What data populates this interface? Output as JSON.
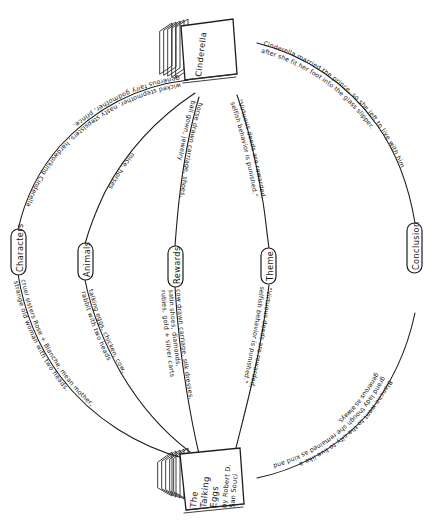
{
  "document": {
    "type": "hand-drawn mind map",
    "title": "Cinderella / The Talking Eggs comparison mind map",
    "ink_color": "#1d1d1d",
    "paper_color": "#ffffff"
  },
  "top_book": {
    "name": "Cinderella",
    "label": "Cinderella"
  },
  "bottom_book": {
    "name": "The Talking Eggs",
    "line1": "The",
    "line2": "Talking",
    "line3": "Eggs",
    "line4": "by Robert D.",
    "line5": "San Souci"
  },
  "nodes": [
    {
      "id": "characters",
      "label": "Characters"
    },
    {
      "id": "animals",
      "label": "Animals"
    },
    {
      "id": "rewards",
      "label": "Rewards"
    },
    {
      "id": "theme",
      "label": "Theme"
    },
    {
      "id": "conclusion",
      "label": "Conclusion"
    }
  ],
  "branches_top": [
    {
      "node": "characters",
      "side": "top",
      "line1": "wicked stepmother, nasty stepsisters, hardworking Cinderella",
      "line2": "generous fairy godmother, prince."
    },
    {
      "node": "animals",
      "side": "top",
      "line1": "mice, horses"
    },
    {
      "node": "rewards",
      "side": "top",
      "line1": "horse drawn carriage, shoes,",
      "line2": "ball gown, jewelry"
    },
    {
      "node": "theme",
      "side": "top",
      "line1": "\"Virtuous deeds are rewarded,",
      "line2": "selfish behavior is punished.\""
    },
    {
      "node": "conclusion",
      "side": "top",
      "line1": "Cinderella married the prince, so she left to live with him",
      "line2": "after she fit her foot into the glass slipper."
    }
  ],
  "branches_bottom": [
    {
      "node": "characters",
      "side": "bottom",
      "line1": "cruel sisters Rose + Blanche, mean mother,",
      "line2": "strange old woman with two heads."
    },
    {
      "node": "animals",
      "side": "bottom",
      "line1": "talking eggs, chicken, cow,",
      "line2": "rabbit with two heads"
    },
    {
      "node": "rewards",
      "side": "bottom",
      "line1": "cow drawn carriage, silk dresses,",
      "line2": "satin shoes, diamonds,",
      "line3": "rubies, gold + silver carts"
    },
    {
      "node": "theme",
      "side": "bottom",
      "line1": "\"Virtuous deeds are rewarded,",
      "line2": "selfish behavior is punished.\""
    },
    {
      "node": "conclusion",
      "side": "bottom",
      "line1": "Blanche went to the city to live like a",
      "line2": "grand lady though she remained as kind and",
      "line3": "generous as always."
    }
  ]
}
